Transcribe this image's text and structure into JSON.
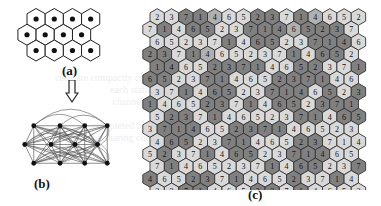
{
  "figure": {
    "panels": [
      {
        "id": "a",
        "label": "(a)",
        "description": "Hexagonal cell layout (3 rows of 4 hexagonal cells, each with a center node)"
      },
      {
        "id": "b",
        "label": "(b)",
        "description": "Fully connected graph of 12 cell nodes"
      },
      {
        "id": "c",
        "label": "(c)",
        "description": "Hexagonal grid with 7-color assignment"
      }
    ],
    "panel_a": {
      "rows": [
        {
          "offset": 1,
          "count": 4
        },
        {
          "offset": 0,
          "count": 4
        },
        {
          "offset": 1,
          "count": 4
        }
      ]
    },
    "panel_b": {
      "nodes": [
        [
          20,
          25
        ],
        [
          55,
          25
        ],
        [
          88,
          25
        ],
        [
          118,
          25
        ],
        [
          8,
          50
        ],
        [
          43,
          50
        ],
        [
          75,
          50
        ],
        [
          105,
          50
        ],
        [
          20,
          75
        ],
        [
          55,
          75
        ],
        [
          88,
          75
        ],
        [
          118,
          75
        ]
      ]
    },
    "panel_c": {
      "shade_colors": {
        "L": "#d9d9d9",
        "M": "#b0b0b0",
        "D": "#808080"
      },
      "rows": [
        {
          "values": [
            2,
            3,
            7,
            1,
            4,
            6,
            5,
            2,
            3,
            7,
            1,
            4,
            6,
            5,
            2
          ],
          "shades": "LLDDMLLDDLDMLLL"
        },
        {
          "values": [
            7,
            1,
            4,
            6,
            5,
            2,
            3,
            7,
            1,
            4,
            6,
            5,
            2,
            3,
            7
          ],
          "shades": "LDLDDLLDDDMDDDL"
        },
        {
          "values": [
            6,
            5,
            2,
            3,
            7,
            1,
            4,
            6,
            5,
            2,
            3,
            7,
            1,
            4,
            6
          ],
          "shades": "LLLLLDLDDLLDDDL"
        },
        {
          "values": [
            2,
            3,
            7,
            1,
            4,
            6,
            5,
            2,
            3,
            7,
            1,
            4,
            6,
            5,
            2
          ],
          "shades": "DDLDMLLLLLDLDDL"
        },
        {
          "values": [
            1,
            4,
            6,
            5,
            2,
            3,
            7,
            1,
            4,
            6,
            5,
            2,
            3,
            7,
            1
          ],
          "shades": "DDLLDDDDLLDDLLD"
        },
        {
          "values": [
            6,
            5,
            2,
            3,
            7,
            1,
            4,
            6,
            5,
            2,
            3,
            7,
            1,
            4,
            6
          ],
          "shades": "DDLLDDLLLDDDDLL"
        },
        {
          "values": [
            3,
            7,
            1,
            4,
            6,
            5,
            2,
            3,
            7,
            1,
            4,
            6,
            5,
            2,
            3
          ],
          "shades": "LLDLDDLLDDDLDLD"
        },
        {
          "values": [
            1,
            4,
            6,
            5,
            2,
            3,
            7,
            1,
            4,
            6,
            5,
            2,
            3,
            7,
            1
          ],
          "shades": "DLLLDDLDLDDLDDD"
        },
        {
          "values": [
            5,
            2,
            3,
            7,
            1,
            4,
            6,
            5,
            2,
            3,
            7,
            1,
            4,
            6,
            5
          ],
          "shades": "LDDLDLLLLLDDLDD"
        },
        {
          "values": [
            3,
            7,
            1,
            4,
            6,
            5,
            2,
            3,
            7,
            1,
            4,
            6,
            5,
            2,
            3
          ],
          "shades": "LDDDLLDDDDLLLLL"
        },
        {
          "values": [
            4,
            6,
            5,
            2,
            3,
            7,
            1,
            4,
            6,
            5,
            2,
            3,
            7,
            1,
            4
          ],
          "shades": "LDDLLDDLLLDDLLL"
        },
        {
          "values": [
            5,
            2,
            3,
            7,
            1,
            4,
            6,
            5,
            2,
            3,
            7,
            1,
            4,
            6,
            5
          ],
          "shades": "LDLLDLDDLLDDDLL"
        },
        {
          "values": [
            7,
            1,
            4,
            6,
            5,
            2,
            3,
            7,
            1,
            4,
            6,
            5,
            2,
            3,
            7
          ],
          "shades": "LDLLLLLLDLDDLLD"
        },
        {
          "values": [
            4,
            6,
            5,
            2,
            3,
            7,
            1,
            4,
            6,
            5,
            2,
            3,
            7,
            1,
            4
          ],
          "shades": "DLLDDLDLLLDLLDL"
        },
        {
          "values": [
            2,
            3,
            7,
            1,
            4,
            6,
            5,
            2,
            3,
            7,
            1,
            4,
            6,
            5,
            2
          ],
          "shades": "LLDDLLLDDLDLLLL"
        }
      ]
    }
  }
}
